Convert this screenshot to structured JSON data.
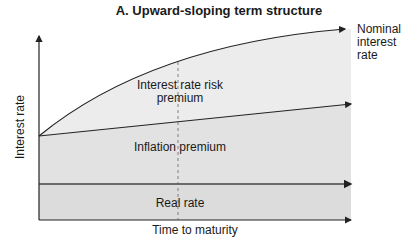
{
  "title": "A. Upward-sloping term structure",
  "axes": {
    "y_label": "Interest rate",
    "x_label": "Time to maturity"
  },
  "curves": {
    "nominal_label": "Nominal interest rate",
    "nominal_lines": [
      "Nominal",
      "interest",
      "rate"
    ]
  },
  "regions": {
    "risk": "Interest rate risk premium",
    "inflation": "Inflation premium",
    "real": "Real rate"
  },
  "colors": {
    "fill": "#e4e4e4",
    "fill_dark": "#d9d9d9",
    "line": "#222222"
  }
}
